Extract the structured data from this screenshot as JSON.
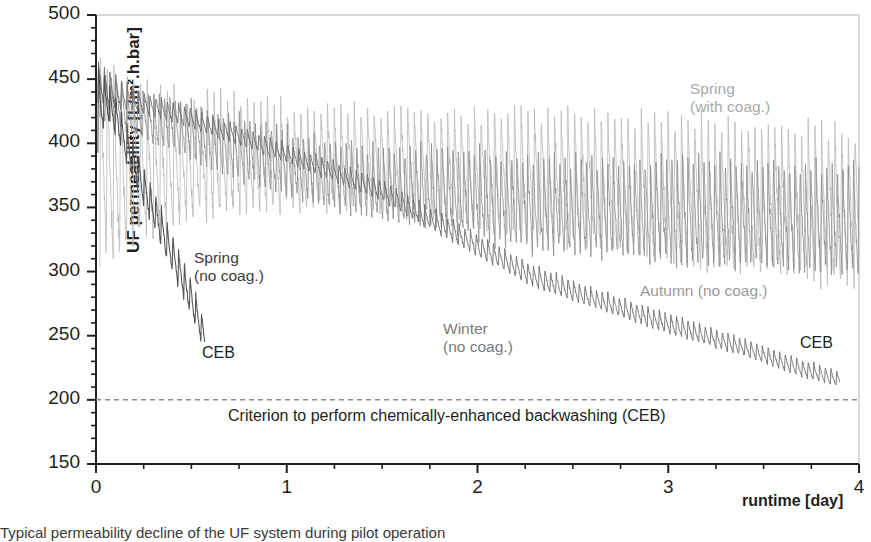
{
  "axes": {
    "ylabel": "UF permeability [L/m².h.bar]",
    "xlabel": "runtime [day]",
    "yticks": [
      "500",
      "450",
      "400",
      "350",
      "300",
      "250",
      "200",
      "150"
    ],
    "ytick_values": [
      500,
      450,
      400,
      350,
      300,
      250,
      200,
      150
    ],
    "xticks": [
      "0",
      "1",
      "2",
      "3",
      "4"
    ],
    "xtick_values": [
      0,
      1,
      2,
      3,
      4
    ],
    "ylim": [
      150,
      500
    ],
    "xlim": [
      0,
      4
    ],
    "y_minor_step": 10,
    "x_minor_step": 0.25,
    "grid": false,
    "frame": "box"
  },
  "annotations": {
    "spring_with_coag_line1": "Spring",
    "spring_with_coag_line2": "(with coag.)",
    "spring_no_coag_line1": "Spring",
    "spring_no_coag_line2": "(no coag.)",
    "winter_no_coag_line1": "Winter",
    "winter_no_coag_line2": "(no coag.)",
    "autumn_no_coag": "Autumn (no coag.)",
    "ceb_left": "CEB",
    "ceb_right": "CEB",
    "criterion": "Criterion to perform chemically-enhanced backwashing (CEB)"
  },
  "caption": "Typical permeability decline of the UF system during pilot operation",
  "colors": {
    "spring_with_coag": "#b9b9bb",
    "spring_no_coag": "#4a4a4c",
    "winter_no_coag": "#6e6e70",
    "autumn_no_coag": "#8e8e90",
    "criterion_line": "#8c8c8e",
    "axis": "#231f20",
    "text": "#231f20"
  },
  "chart_data": {
    "type": "line",
    "title": "",
    "xlabel": "runtime [day]",
    "ylabel": "UF permeability [L/m².h.bar]",
    "xlim": [
      0,
      4
    ],
    "ylim": [
      150,
      500
    ],
    "grid": false,
    "legend": "in-plot annotations",
    "reference_lines": [
      {
        "label": "Criterion to perform chemically-enhanced backwashing (CEB)",
        "y": 200,
        "style": "dashed",
        "color": "#8c8c8e"
      }
    ],
    "notes": [
      "Each series is a sawtooth: permeability recovers at each backwash then declines.",
      "Values below are the cycle-envelope (upper peak / lower trough) readings off the axes."
    ],
    "series": [
      {
        "name": "Spring (with coag.)",
        "color": "#b9b9bb",
        "x_start": 0.02,
        "x_end": 4.0,
        "envelope_x": [
          0.02,
          0.1,
          0.3,
          0.6,
          1.0,
          1.4,
          1.8,
          2.2,
          2.6,
          3.0,
          3.4,
          3.7,
          4.0
        ],
        "envelope_high": [
          478,
          455,
          445,
          440,
          432,
          430,
          428,
          430,
          425,
          425,
          420,
          418,
          415
        ],
        "envelope_low": [
          310,
          312,
          330,
          345,
          350,
          350,
          340,
          330,
          320,
          310,
          300,
          295,
          292
        ],
        "cycle_period_days": 0.035,
        "end_value": 300
      },
      {
        "name": "Spring (no coag.)",
        "color": "#4a4a4c",
        "x_start": 0.01,
        "x_end": 0.57,
        "envelope_x": [
          0.01,
          0.05,
          0.1,
          0.2,
          0.3,
          0.4,
          0.5,
          0.57
        ],
        "envelope_high": [
          470,
          452,
          440,
          400,
          365,
          330,
          295,
          262
        ],
        "envelope_low": [
          390,
          420,
          408,
          370,
          335,
          300,
          265,
          238
        ],
        "cycle_period_days": 0.03,
        "end_value": 240,
        "terminates_at_ceb": true
      },
      {
        "name": "Winter (no coag.)",
        "color": "#6e6e70",
        "x_start": 0.01,
        "x_end": 3.9,
        "envelope_x": [
          0.01,
          0.2,
          0.5,
          1.0,
          1.5,
          2.0,
          2.3,
          2.6,
          3.0,
          3.4,
          3.7,
          3.9
        ],
        "envelope_high": [
          465,
          442,
          428,
          400,
          372,
          330,
          305,
          288,
          268,
          248,
          232,
          222
        ],
        "envelope_low": [
          430,
          425,
          412,
          385,
          355,
          312,
          288,
          272,
          252,
          234,
          218,
          210
        ],
        "cycle_period_days": 0.03,
        "end_value": 215,
        "terminates_at_ceb": true
      },
      {
        "name": "Autumn (no coag.)",
        "color": "#8e8e90",
        "x_start": 0.02,
        "x_end": 4.0,
        "envelope_x": [
          0.02,
          0.3,
          0.7,
          1.1,
          1.5,
          1.9,
          2.2,
          2.6,
          3.0,
          3.4,
          3.7,
          4.0
        ],
        "envelope_high": [
          455,
          440,
          425,
          408,
          398,
          400,
          395,
          390,
          392,
          390,
          388,
          385
        ],
        "envelope_low": [
          418,
          400,
          375,
          355,
          340,
          330,
          318,
          312,
          308,
          305,
          300,
          298
        ],
        "cycle_period_days": 0.028,
        "end_value": 305
      }
    ]
  }
}
